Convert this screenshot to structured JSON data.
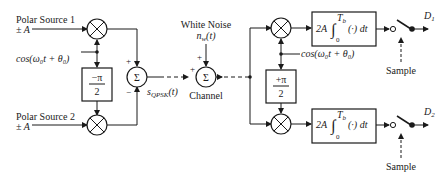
{
  "sources": {
    "source1": {
      "name": "Polar Source 1",
      "amplitude": "± A"
    },
    "source2": {
      "name": "Polar Source 2",
      "amplitude": "± A"
    }
  },
  "carrier": {
    "label": "cos(ω₀t + θ₀)"
  },
  "phase_shift_tx": {
    "num": "−π",
    "den": "2"
  },
  "phase_shift_rx": {
    "num": "+π",
    "den": "2"
  },
  "modulator_sum": {
    "symbol": "Σ",
    "sign_top": "+",
    "sign_bottom": "−"
  },
  "signal_label": {
    "main": "s",
    "sub": "QPSK",
    "arg": "(t)"
  },
  "noise": {
    "title": "White Noise",
    "label_main": "n",
    "label_sub": "w",
    "label_arg": "(t)"
  },
  "channel": {
    "symbol": "Σ",
    "label": "Channel",
    "sign_top": "+",
    "sign_left": "+"
  },
  "integrator": {
    "gain": "2A",
    "upper": "T",
    "upper_sub": "b",
    "lower": "0",
    "body": "(·) dt"
  },
  "outputs": {
    "d1": "D",
    "d1_sub": "1",
    "d2": "D",
    "d2_sub": "2"
  },
  "sample_label": "Sample",
  "multiplier_symbol": "×"
}
